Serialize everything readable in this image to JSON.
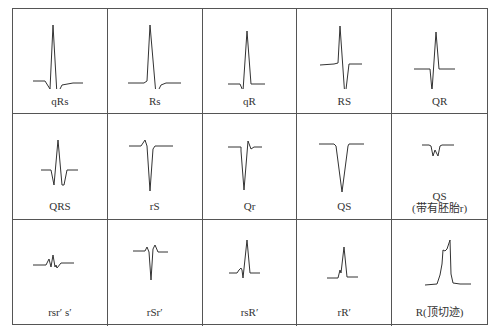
{
  "diagram": {
    "type": "ecg_qrs_morphology_grid",
    "columns": 5,
    "rows": 3,
    "cells": [
      {
        "label": "qRs",
        "points": "20,72 32,72 37,80 40,16 44,86 49,76 60,74 70,74"
      },
      {
        "label": "Rs",
        "points": "20,74 36,74 39,72 42,16 48,86 53,76 58,74 73,74"
      },
      {
        "label": "qR",
        "points": "25,75 37,75 40,82 44,22 48,75 62,75"
      },
      {
        "label": "RS",
        "points": "23,56 37,55 41,54 43,17 48,89 52,55 65,55"
      },
      {
        "label": "QR",
        "points": "22,60 38,60 40,82 44,23 47,60 63,60"
      },
      {
        "label": "QRS",
        "points": "28,56 38,56 41,71 45,26 49,71 51,71 54,56 65,56"
      },
      {
        "label": "rS",
        "points": "21,32 33,32 37,26 39,32 42,77 45,35 47,32 65,32"
      },
      {
        "label": "Qr",
        "points": "25,33 38,33 38,37 41,76 45,27 48,35 51,33 59,33"
      },
      {
        "label": "QS",
        "points": "22,30 37,30 39,32 45,78 51,32 52,30 67,30"
      },
      {
        "label_lines": [
          "QS",
          "(带有胚胎r)"
        ],
        "points": "30,31 37,31 39,32 41,42 43,36 46,42 48,32 50,31 62,31"
      },
      {
        "label": "rsr′ s′",
        "points": "20,45 33,45 36,39 38,47 40,35 42,47 43,45 44,48 48,43 61,43"
      },
      {
        "label": "rSr′",
        "points": "25,31 37,31 39,27 41,32 43,60 45,29 47,25 50,32 60,32"
      },
      {
        "label": "rsR′",
        "points": "26,53 34,53 36,50 38,48 39,50 40,58 44,20 47,53 57,53"
      },
      {
        "label": "rR′",
        "points": "30,58 41,58 43,50 44,53 47,27 50,57 61,57"
      },
      {
        "label": "R(顶切迹)",
        "points": "33,65 45,64 48,55 50,44 51,30 53,31 55,29 58,20 59,54 61,63 68,64 79,64"
      }
    ]
  }
}
